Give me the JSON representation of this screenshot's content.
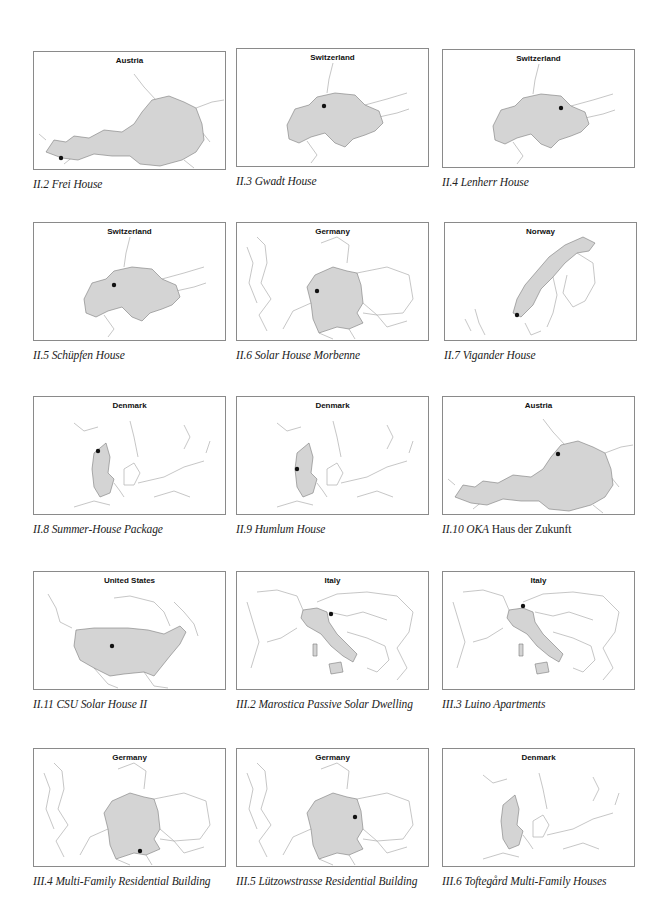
{
  "page": {
    "background": "#ffffff",
    "fill_color": "#d4d4d4",
    "border_color": "#8a8a8a",
    "marker_color": "#111111"
  },
  "figures": [
    {
      "id": "II.2",
      "country": "Austria",
      "caption": "II.2 Frei House",
      "caption_italic": "II.2 Frei House",
      "caption_roman": "",
      "shape": "austria",
      "marker": "west"
    },
    {
      "id": "II.3",
      "country": "Switzerland",
      "caption": "II.3 Gwadt House",
      "caption_italic": "II.3 Gwadt House",
      "caption_roman": "",
      "shape": "switzerland",
      "marker": "center"
    },
    {
      "id": "II.4",
      "country": "Switzerland",
      "caption": "II.4 Lenherr House",
      "caption_italic": "II.4 Lenherr House",
      "caption_roman": "",
      "shape": "switzerland",
      "marker": "northeast"
    },
    {
      "id": "II.5",
      "country": "Switzerland",
      "caption": "II.5 Schüpfen House",
      "caption_italic": "II.5 Schüpfen House",
      "caption_roman": "",
      "shape": "switzerland",
      "marker": "west-center"
    },
    {
      "id": "II.6",
      "country": "Germany",
      "caption": "II.6 Solar House Morbenne",
      "caption_italic": "II.6 Solar House Morbenne",
      "caption_roman": "",
      "shape": "germany",
      "marker": "west"
    },
    {
      "id": "II.7",
      "country": "Norway",
      "caption": "II.7 Vigander House",
      "caption_italic": "II.7 Vigander House",
      "caption_roman": "",
      "shape": "norway",
      "marker": "south"
    },
    {
      "id": "II.8",
      "country": "Denmark",
      "caption": "II.8 Summer-House Package",
      "caption_italic": "II.8 Summer-House Package",
      "caption_roman": "",
      "shape": "denmark",
      "marker": "north"
    },
    {
      "id": "II.9",
      "country": "Denmark",
      "caption": "II.9 Humlum House",
      "caption_italic": "II.9 Humlum House",
      "caption_roman": "",
      "shape": "denmark",
      "marker": "west"
    },
    {
      "id": "II.10",
      "country": "Austria",
      "caption": "II.10 OKA Haus der Zukunft",
      "caption_italic": "II.10 OKA",
      "caption_roman": " Haus der Zukunft",
      "shape": "austria",
      "marker": "north"
    },
    {
      "id": "II.11",
      "country": "United States",
      "caption": "II.11 CSU Solar House II",
      "caption_italic": "II.11 CSU Solar House II",
      "caption_roman": "",
      "shape": "usa",
      "marker": "center"
    },
    {
      "id": "III.2",
      "country": "Italy",
      "caption": "III.2 Marostica Passive Solar Dwelling",
      "caption_italic": "III.2 Marostica Passive Solar Dwelling",
      "caption_roman": "",
      "shape": "italy",
      "marker": "northeast"
    },
    {
      "id": "III.3",
      "country": "Italy",
      "caption": "III.3 Luino Apartments",
      "caption_italic": "III.3 Luino Apartments",
      "caption_roman": "",
      "shape": "italy",
      "marker": "northwest"
    },
    {
      "id": "III.4",
      "country": "Germany",
      "caption": "III.4 Multi-Family Residential Building",
      "caption_italic": "III.4 Multi-Family Residential Building",
      "caption_roman": "",
      "shape": "germany",
      "marker": "south"
    },
    {
      "id": "III.5",
      "country": "Germany",
      "caption": "III.5 Lützowstrasse Residential Building",
      "caption_italic": "III.5 Lützowstrasse Residential Building",
      "caption_roman": "",
      "shape": "germany",
      "marker": "northeast"
    },
    {
      "id": "III.6",
      "country": "Denmark",
      "caption": "III.6 Toftegård Multi-Family Houses",
      "caption_italic": "III.6 Toftegård Multi-Family Houses",
      "caption_roman": "",
      "shape": "denmark",
      "marker": "none"
    }
  ]
}
